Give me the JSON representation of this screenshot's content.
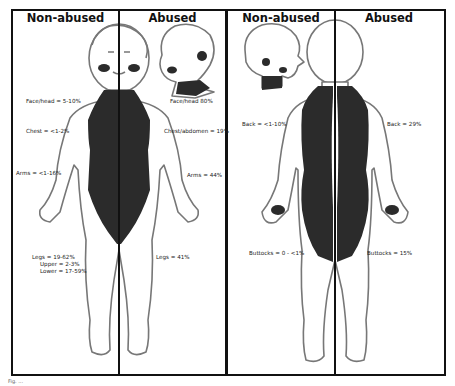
{
  "panels": {
    "front": {
      "left_header": "Non-abused",
      "right_header": "Abused",
      "non_abused_labels": {
        "face_head": "Face/head = 5-10%",
        "chest": "Chest = <1-2%",
        "arms": "Arms = <1-16%",
        "legs": "Legs = 19-62%",
        "legs_upper": "Upper = 2-3%",
        "legs_lower": "Lower = 17-59%"
      },
      "abused_labels": {
        "face_head": "Face/head 80%",
        "chest_abdomen": "Chest/abdomen = 19%",
        "arms": "Arms = 44%",
        "legs": "Legs = 41%"
      }
    },
    "back": {
      "left_header": "Non-abused",
      "right_header": "Abused",
      "non_abused_labels": {
        "back": "Back = <1-10%",
        "buttocks": "Buttocks = 0 - <1%"
      },
      "abused_labels": {
        "back": "Back = 29%",
        "buttocks": "Buttocks = 15%"
      }
    }
  },
  "colors": {
    "frame": "#111111",
    "shaded_region": "#2b2b2b",
    "outline": "#777777"
  },
  "caption": "Fig. ..."
}
